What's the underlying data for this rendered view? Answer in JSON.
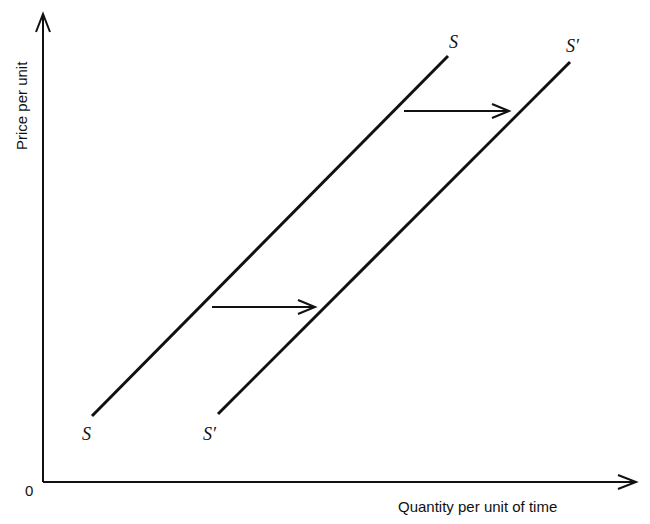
{
  "diagram": {
    "y_axis_label": "Price per unit",
    "x_axis_label": "Quantity per unit of time",
    "origin_label": "0",
    "curves": [
      {
        "id": "S",
        "label_top": "S",
        "label_bottom": "S",
        "x1": 92,
        "y1": 416,
        "x2": 448,
        "y2": 56
      },
      {
        "id": "S_prime",
        "label_top": "S′",
        "label_bottom": "S′",
        "x1": 218,
        "y1": 414,
        "x2": 570,
        "y2": 62
      }
    ],
    "shift_arrows": [
      {
        "x1": 212,
        "y1": 307,
        "x2": 314,
        "y2": 307
      },
      {
        "x1": 404,
        "y1": 111,
        "x2": 508,
        "y2": 111
      }
    ],
    "colors": {
      "ink": "#111111",
      "background": "#ffffff"
    }
  }
}
